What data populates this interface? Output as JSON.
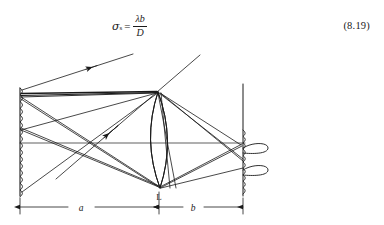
{
  "equation": {
    "symbol": "σ",
    "symbol_subscript": "s",
    "equals": "=",
    "numerator": "λb",
    "denominator": "D",
    "number": "(8.19)",
    "plain_text": "σ_s = λb / D"
  },
  "figure": {
    "labels": {
      "lens": "L",
      "object_to_lens_distance": "a",
      "lens_to_image_distance": "b"
    },
    "parts": {
      "object_plane": "object-plane-wavy-line",
      "lens": "biconvex-lens",
      "image_plane": "image-plane-wavy-line",
      "optical_axis": "optical-axis",
      "diffraction_lobes": "diffraction-pattern-lobes",
      "incoming_rays": "illumination-rays-with-arrowheads"
    },
    "colors": {
      "ink": "#1a1a1a",
      "background": "#ffffff"
    }
  }
}
